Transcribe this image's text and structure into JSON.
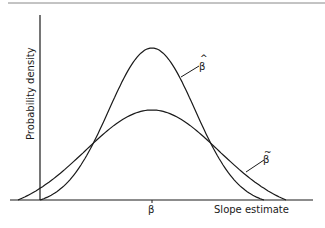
{
  "chart_data": {
    "type": "line",
    "title": "",
    "xlabel": "Slope estimate",
    "ylabel": "Probability density",
    "x_ticks": [
      {
        "label": "β",
        "position": "true value"
      }
    ],
    "grid": false,
    "legend": "inline labels",
    "series": [
      {
        "name": "β̂",
        "label_symbol": "β",
        "label_accent": "^",
        "description": "narrow, taller density centered at β",
        "x": [
          -4,
          -3,
          -2,
          -1,
          0,
          1,
          2,
          3,
          4
        ],
        "y": [
          0.0,
          0.03,
          0.25,
          0.72,
          1.0,
          0.72,
          0.25,
          0.03,
          0.0
        ]
      },
      {
        "name": "β̃",
        "label_symbol": "β",
        "label_accent": "~",
        "description": "wider, flatter density centered at β",
        "x": [
          -4.5,
          -3,
          -2,
          -1,
          0,
          1,
          2,
          3,
          4.5
        ],
        "y": [
          0.0,
          0.1,
          0.3,
          0.52,
          0.59,
          0.52,
          0.3,
          0.1,
          0.0
        ]
      }
    ],
    "colors": {
      "line": "#1a1a1a",
      "background": "#ffffff"
    }
  },
  "labels": {
    "ylabel": "Probability density",
    "xlabel": "Slope estimate",
    "tick_beta": "β",
    "beta_hat_symbol": "β",
    "beta_hat_accent": "^",
    "beta_tilde_symbol": "β",
    "beta_tilde_accent": "~"
  }
}
